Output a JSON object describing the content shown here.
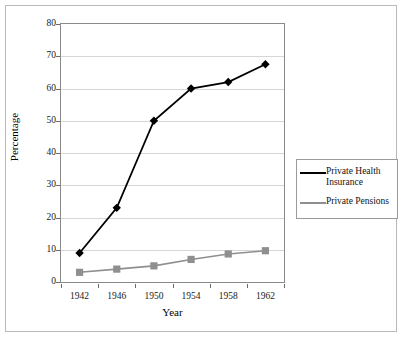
{
  "chart_data": {
    "type": "line",
    "title": "",
    "xlabel": "Year",
    "ylabel": "Percentage",
    "categories": [
      1942,
      1946,
      1950,
      1954,
      1958,
      1962
    ],
    "xtick_labels": [
      "1942",
      "1946",
      "1950",
      "1954",
      "1958",
      "1962"
    ],
    "ytick_labels": [
      "0",
      "10",
      "20",
      "30",
      "40",
      "50",
      "60",
      "70",
      "80"
    ],
    "yticks": [
      0,
      10,
      20,
      30,
      40,
      50,
      60,
      70,
      80
    ],
    "ylim": [
      0,
      80
    ],
    "grid": "horizontal",
    "legend_position": "right",
    "series": [
      {
        "name": "Private Health Insurance",
        "marker": "diamond",
        "color": "#000000",
        "values": [
          9,
          23,
          50,
          60,
          62,
          67.5
        ]
      },
      {
        "name": "Private Pensions",
        "marker": "square",
        "color": "#8f8f8f",
        "values": [
          3,
          4,
          5,
          7,
          8.7,
          9.7
        ]
      }
    ],
    "legend_entries": [
      "Private Health Insurance",
      "Private Pensions"
    ]
  },
  "colors": {
    "series1": "#000000",
    "series2": "#8f8f8f",
    "gridline": "#d6d6d6",
    "axis": "#8a8a8a",
    "frame": "#b9b9b9"
  }
}
